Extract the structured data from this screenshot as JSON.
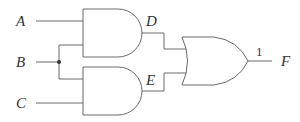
{
  "diagram": {
    "type": "logic-circuit",
    "inputs": [
      {
        "id": "A",
        "label": "A"
      },
      {
        "id": "B",
        "label": "B"
      },
      {
        "id": "C",
        "label": "C"
      }
    ],
    "gates": [
      {
        "id": "and1",
        "type": "AND",
        "inputs": [
          "A",
          "B"
        ],
        "output": "D"
      },
      {
        "id": "and2",
        "type": "AND",
        "inputs": [
          "B",
          "C"
        ],
        "output": "E"
      },
      {
        "id": "or1",
        "type": "OR",
        "inputs": [
          "D",
          "E"
        ],
        "output": "F"
      }
    ],
    "intermediate": [
      {
        "id": "D",
        "label": "D"
      },
      {
        "id": "E",
        "label": "E"
      }
    ],
    "output": {
      "id": "F",
      "label": "F",
      "value": "1"
    }
  },
  "colors": {
    "line": "#6a6a6a",
    "text": "#333333",
    "background": "#ffffff"
  }
}
